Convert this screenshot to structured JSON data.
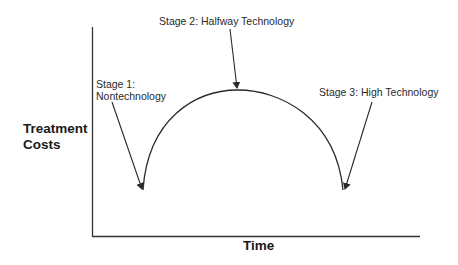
{
  "diagram": {
    "type": "conceptual-curve",
    "y_axis_label_line1": "Treatment",
    "y_axis_label_line2": "Costs",
    "x_axis_label": "Time",
    "stages": [
      {
        "line1": "Stage 1:",
        "line2": "Nontechnology"
      },
      {
        "line1": "Stage 2: Halfway Technology"
      },
      {
        "line1": "Stage 3: High Technology"
      }
    ],
    "colors": {
      "line": "#2a2a2a",
      "text": "#2a2a2a",
      "background": "#ffffff"
    }
  }
}
